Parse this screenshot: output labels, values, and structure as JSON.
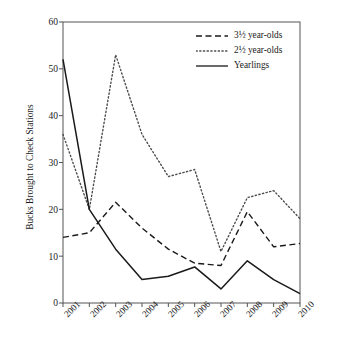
{
  "chart_data": {
    "type": "line",
    "title": "",
    "subtitle": "",
    "xlabel": "",
    "ylabel": "Bucks Brought to Check Stations",
    "categories": [
      "2001",
      "2002",
      "2003",
      "2004",
      "2005",
      "2006",
      "2007",
      "2008",
      "2009",
      "2010"
    ],
    "x": [
      2001,
      2002,
      2003,
      2004,
      2005,
      2006,
      2007,
      2008,
      2009,
      2010
    ],
    "ylim": [
      0,
      60
    ],
    "yticks": [
      0,
      10,
      20,
      30,
      40,
      50,
      60
    ],
    "ytick_labels": [
      "0",
      "10",
      "20",
      "30",
      "40",
      "50",
      "60"
    ],
    "grid": false,
    "legend_position": "top-right",
    "series": [
      {
        "name": "3½ year-olds",
        "style": "dashed",
        "color": "#1a1a1a",
        "values": [
          14,
          15,
          21.5,
          16,
          11.5,
          8.5,
          8,
          19.5,
          12,
          12.7
        ]
      },
      {
        "name": "2½ year-olds",
        "style": "dotted",
        "color": "#4d4d4d",
        "values": [
          36,
          20,
          53,
          36,
          27,
          28.5,
          11,
          22.5,
          24,
          18
        ]
      },
      {
        "name": "Yearlings",
        "style": "solid",
        "color": "#1a1a1a",
        "values": [
          52,
          20,
          11.5,
          5,
          5.7,
          7.7,
          3,
          9,
          5,
          2
        ]
      }
    ]
  },
  "axes": {
    "y_axis_title": "Bucks Brought to Check Stations",
    "y_tick_labels": [
      "60",
      "50",
      "40",
      "30",
      "20",
      "10",
      "0"
    ],
    "x_tick_labels": [
      "2001",
      "2002",
      "2003",
      "2004",
      "2005",
      "2006",
      "2007",
      "2008",
      "2009",
      "2010"
    ]
  },
  "legend": {
    "entries": [
      {
        "label": "3½ year-olds",
        "style": "dashed"
      },
      {
        "label": "2½ year-olds",
        "style": "dotted"
      },
      {
        "label": "Yearlings",
        "style": "solid"
      }
    ]
  }
}
